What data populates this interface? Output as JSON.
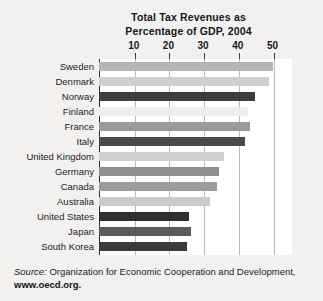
{
  "chart_data": {
    "type": "bar",
    "orientation": "horizontal",
    "title": "Total Tax Revenues as Percentage of GDP, 2004",
    "title_lines": [
      "Total Tax Revenues as",
      "Percentage of GDP, 2004"
    ],
    "xlabel": "",
    "ylabel": "",
    "xlim": [
      0,
      52
    ],
    "ticks": [
      10,
      20,
      30,
      40,
      50
    ],
    "tick_labels": [
      "10",
      "20",
      "30",
      "40",
      "50"
    ],
    "grid": "vertical",
    "axis_position": "top",
    "legend": "none",
    "categories": [
      "Sweden",
      "Denmark",
      "Norway",
      "Finland",
      "France",
      "Italy",
      "United Kingdom",
      "Germany",
      "Canada",
      "Australia",
      "United States",
      "Japan",
      "South Korea"
    ],
    "values": [
      50.0,
      49.0,
      45.0,
      43.0,
      43.5,
      42.0,
      36.0,
      34.5,
      34.0,
      32.0,
      26.0,
      26.5,
      25.5
    ],
    "bar_colors": [
      "#b6b6b6",
      "#cfcfcf",
      "#3d3d3d",
      "#eeeeee",
      "#9a9a9a",
      "#4a4a4a",
      "#d0d0d0",
      "#8f8f8f",
      "#9c9c9c",
      "#cbcbcb",
      "#2f2f2f",
      "#5a5a5a",
      "#3a3a3a"
    ]
  },
  "source": {
    "prefix": "Source:",
    "line1_rest": " Organization for Economic Cooperation and Development,",
    "line2": "www.oecd.org."
  },
  "colors": {
    "background": "#f2f1ef",
    "plot_background": "#ffffff",
    "axis": "#2a2a2a",
    "grid": "#b9b9b9",
    "text": "#1b1b1f"
  }
}
